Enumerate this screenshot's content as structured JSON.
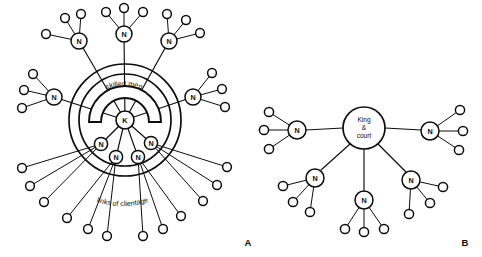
{
  "figure": {
    "width": 482,
    "height": 257,
    "background": "#ffffff",
    "ink_color": "#0d0d0d"
  },
  "panels": [
    {
      "id": "panel-a",
      "letter": "A",
      "letter_pos": {
        "x": 248,
        "y": 243
      },
      "center": {
        "x": 125,
        "y": 120,
        "label": "K",
        "radius": 9
      },
      "rings": [
        {
          "radius": 56,
          "name": "outer-ring"
        },
        {
          "radius": 46,
          "name": "inner-ring"
        }
      ],
      "annotations": [
        {
          "name": "skilled-men-label",
          "text": "skilled men",
          "x": 123,
          "y": 96
        },
        {
          "name": "links-of-clientage-label",
          "text": "links of clientage",
          "x": 122,
          "y": 196
        }
      ],
      "nobles": [
        {
          "label": "N",
          "x": 79,
          "y": 41,
          "r": 8,
          "leaves": 3,
          "ring": "outside"
        },
        {
          "label": "N",
          "x": 124,
          "y": 34,
          "r": 8,
          "leaves": 3,
          "ring": "outside"
        },
        {
          "label": "N",
          "x": 169,
          "y": 41,
          "r": 8,
          "leaves": 3,
          "ring": "outside"
        },
        {
          "label": "N",
          "x": 54,
          "y": 97,
          "r": 8,
          "leaves": 3,
          "ring": "outside"
        },
        {
          "label": "N",
          "x": 193,
          "y": 97,
          "r": 8,
          "leaves": 3,
          "ring": "outside"
        },
        {
          "label": "N",
          "x": 101,
          "y": 144,
          "r": 6.6,
          "leaves": 3,
          "ring": "inside"
        },
        {
          "label": "N",
          "x": 151,
          "y": 143,
          "r": 6.6,
          "leaves": 3,
          "ring": "inside"
        },
        {
          "label": "N",
          "x": 116,
          "y": 157,
          "r": 6.6,
          "leaves": 3,
          "ring": "inside"
        },
        {
          "label": "N",
          "x": 138,
          "y": 157,
          "r": 6.6,
          "leaves": 3,
          "ring": "inside"
        }
      ],
      "leaf_radius": 4.4,
      "counts": {
        "nobles": 9,
        "clients": 27
      }
    },
    {
      "id": "panel-b",
      "letter": "B",
      "letter_pos": {
        "x": 465,
        "y": 243
      },
      "center": {
        "x": 364,
        "y": 128,
        "label_lines": [
          "King",
          "&",
          "court"
        ],
        "radius": 21
      },
      "nobles": [
        {
          "label": "N",
          "x": 297,
          "y": 130,
          "r": 9,
          "leaves": 3
        },
        {
          "label": "N",
          "x": 430,
          "y": 131,
          "r": 9,
          "leaves": 3
        },
        {
          "label": "N",
          "x": 315,
          "y": 178,
          "r": 9,
          "leaves": 3
        },
        {
          "label": "N",
          "x": 364,
          "y": 200,
          "r": 9,
          "leaves": 3
        },
        {
          "label": "N",
          "x": 411,
          "y": 180,
          "r": 9,
          "leaves": 3
        }
      ],
      "leaf_radius": 4.6,
      "counts": {
        "nobles": 5,
        "clients": 15
      }
    }
  ]
}
